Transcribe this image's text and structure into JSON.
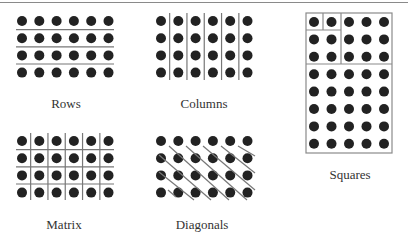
{
  "figure": {
    "panels": [
      {
        "id": "rows",
        "label": "Rows",
        "grid": {
          "cols": 6,
          "rows": 4
        },
        "lines": "horizontal"
      },
      {
        "id": "columns",
        "label": "Columns",
        "grid": {
          "cols": 6,
          "rows": 4
        },
        "lines": "vertical"
      },
      {
        "id": "squares",
        "label": "Squares",
        "grid": {
          "cols": 5,
          "rows": 8
        },
        "lines": "nested-squares"
      },
      {
        "id": "matrix",
        "label": "Matrix",
        "grid": {
          "cols": 6,
          "rows": 4
        },
        "lines": "grid"
      },
      {
        "id": "diagonals",
        "label": "Diagonals",
        "grid": {
          "cols": 6,
          "rows": 4
        },
        "lines": "diagonal"
      }
    ],
    "colors": {
      "dot": "#222222",
      "line": "#777777",
      "border": "#8a8a8a",
      "background": "#ffffff"
    }
  }
}
